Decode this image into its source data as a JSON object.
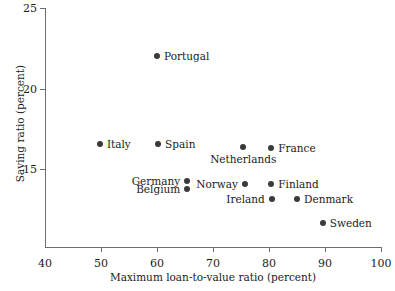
{
  "chart_data": {
    "type": "scatter",
    "title": "",
    "xlabel": "Maximum loan-to-value ratio (percent)",
    "ylabel": "Saving ratio (percent)",
    "xlim": [
      40,
      100
    ],
    "ylim": [
      10.2,
      25
    ],
    "xticks": [
      40,
      50,
      60,
      70,
      80,
      90,
      100
    ],
    "yticks": [
      15,
      20,
      25
    ],
    "xtick_labels": [
      "40",
      "50",
      "60",
      "70",
      "80",
      "90",
      "100"
    ],
    "ytick_labels": [
      "15",
      "20",
      "25"
    ],
    "grid": false,
    "legend": "none",
    "marker_color": "#3a3a3a",
    "axis_color": "#6d6d6d",
    "points": [
      {
        "label": "Portugal",
        "x": 60.0,
        "y": 22.0,
        "label_pos": "right"
      },
      {
        "label": "Italy",
        "x": 49.8,
        "y": 16.6,
        "label_pos": "right"
      },
      {
        "label": "Spain",
        "x": 60.2,
        "y": 16.6,
        "label_pos": "right"
      },
      {
        "label": "Netherlands",
        "x": 75.4,
        "y": 16.4,
        "label_pos": "below"
      },
      {
        "label": "France",
        "x": 80.4,
        "y": 16.3,
        "label_pos": "right"
      },
      {
        "label": "Germany",
        "x": 65.4,
        "y": 14.3,
        "label_pos": "left"
      },
      {
        "label": "Belgium",
        "x": 65.4,
        "y": 13.8,
        "label_pos": "left"
      },
      {
        "label": "Norway",
        "x": 75.7,
        "y": 14.1,
        "label_pos": "left"
      },
      {
        "label": "Finland",
        "x": 80.4,
        "y": 14.1,
        "label_pos": "right"
      },
      {
        "label": "Ireland",
        "x": 80.5,
        "y": 13.2,
        "label_pos": "left"
      },
      {
        "label": "Denmark",
        "x": 85.0,
        "y": 13.2,
        "label_pos": "right"
      },
      {
        "label": "Sweden",
        "x": 89.6,
        "y": 11.7,
        "label_pos": "right"
      }
    ]
  }
}
